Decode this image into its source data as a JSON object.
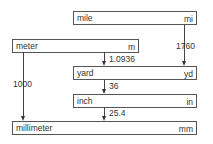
{
  "units": [
    {
      "name": "mile",
      "abbr": "mi"
    },
    {
      "name": "meter",
      "abbr": "m"
    },
    {
      "name": "yard",
      "abbr": "yd"
    },
    {
      "name": "inch",
      "abbr": "in"
    },
    {
      "name": "millimeter",
      "abbr": "mm"
    }
  ],
  "conversions": [
    {
      "from": "mile",
      "to": "yard",
      "factor": "1760"
    },
    {
      "from": "meter",
      "to": "yard",
      "factor": "1.0936"
    },
    {
      "from": "yard",
      "to": "inch",
      "factor": "36"
    },
    {
      "from": "meter",
      "to": "millimeter",
      "factor": "1000"
    },
    {
      "from": "inch",
      "to": "millimeter",
      "factor": "25.4"
    }
  ]
}
